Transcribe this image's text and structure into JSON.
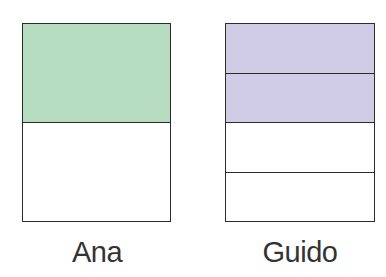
{
  "bars": [
    {
      "label": "Ana",
      "parts": 2,
      "shaded": 1,
      "fill_color": "#b6dcc0",
      "empty_color": "#ffffff"
    },
    {
      "label": "Guido",
      "parts": 4,
      "shaded": 2,
      "fill_color": "#d0cce6",
      "empty_color": "#ffffff"
    }
  ],
  "outline_color": "#2b2b2b"
}
